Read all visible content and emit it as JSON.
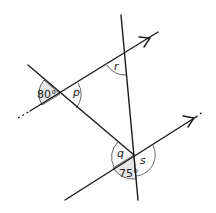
{
  "diagram": {
    "type": "angles-parallel-lines",
    "angles": {
      "known_left": "80°",
      "known_bottom": "75°",
      "p": "p",
      "q": "q",
      "r": "r",
      "s": "s"
    },
    "colors": {
      "line": "#1a1a1a",
      "shade": "#e6e6e6"
    }
  }
}
